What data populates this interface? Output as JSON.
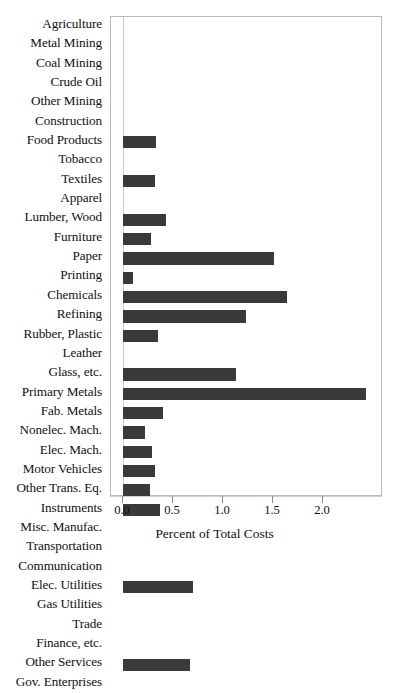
{
  "chart_data": {
    "type": "bar",
    "orientation": "horizontal",
    "title": "",
    "xlabel": "Percent of Total Costs",
    "ylabel": "",
    "xlim": [
      0.0,
      2.6
    ],
    "xticks": [
      0.0,
      0.5,
      1.0,
      1.5,
      2.0
    ],
    "xticklabels": [
      "0.0",
      "0.5",
      "1.0",
      "1.5",
      "2.0"
    ],
    "grid": false,
    "legend": null,
    "bar_color": "#3a3a3a",
    "categories": [
      "Agriculture",
      "Metal Mining",
      "Coal Mining",
      "Crude Oil",
      "Other Mining",
      "Construction",
      "Food Products",
      "Tobacco",
      "Textiles",
      "Apparel",
      "Lumber, Wood",
      "Furniture",
      "Paper",
      "Printing",
      "Chemicals",
      "Refining",
      "Rubber, Plastic",
      "Leather",
      "Glass, etc.",
      "Primary Metals",
      "Fab. Metals",
      "Nonelec. Mach.",
      "Elec. Mach.",
      "Motor Vehicles",
      "Other Trans. Eq.",
      "Instruments",
      "Misc. Manufac.",
      "Transportation",
      "Communication",
      "Elec. Utilities",
      "Gas Utilities",
      "Trade",
      "Finance, etc.",
      "Other Services",
      "Gov. Enterprises"
    ],
    "values": [
      0.0,
      0.0,
      0.0,
      0.0,
      0.0,
      0.0,
      0.33,
      0.0,
      0.32,
      0.0,
      0.43,
      0.28,
      1.51,
      0.1,
      1.64,
      1.23,
      0.35,
      0.0,
      1.13,
      2.43,
      0.4,
      0.22,
      0.29,
      0.32,
      0.27,
      0.37,
      0.0,
      0.0,
      0.0,
      0.7,
      0.0,
      0.0,
      0.0,
      0.67,
      0.0
    ]
  }
}
